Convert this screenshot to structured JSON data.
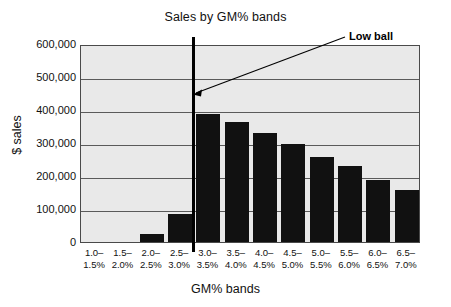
{
  "chart_data": {
    "type": "bar",
    "title": "Sales by GM% bands",
    "xlabel": "GM% bands",
    "ylabel": "$ sales",
    "categories": [
      "1.0–1.5%",
      "1.5–2.0%",
      "2.0–2.5%",
      "2.5–3.0%",
      "3.0–3.5%",
      "3.5–4.0%",
      "4.0–4.5%",
      "4.5–5.0%",
      "5.0–5.5%",
      "5.5–6.0%",
      "6.0–6.5%",
      "6.5–7.0%"
    ],
    "category_lines": [
      [
        "1.0–",
        "1.5%"
      ],
      [
        "1.5–",
        "2.0%"
      ],
      [
        "2.0–",
        "2.5%"
      ],
      [
        "2.5–",
        "3.0%"
      ],
      [
        "3.0–",
        "3.5%"
      ],
      [
        "3.5–",
        "4.0%"
      ],
      [
        "4.0–",
        "4.5%"
      ],
      [
        "4.5–",
        "5.0%"
      ],
      [
        "5.0–",
        "5.5%"
      ],
      [
        "5.5–",
        "6.0%"
      ],
      [
        "6.0–",
        "6.5%"
      ],
      [
        "6.5–",
        "7.0%"
      ]
    ],
    "values": [
      0,
      0,
      25000,
      85000,
      388000,
      365000,
      331000,
      297000,
      258000,
      229000,
      189000,
      157000
    ],
    "ylim": [
      0,
      600000
    ],
    "ytick_values": [
      600000,
      500000,
      400000,
      300000,
      200000,
      100000,
      0
    ],
    "ytick_labels": [
      "600,000",
      "500,000",
      "400,000",
      "300,000",
      "200,000",
      "100,000",
      "0"
    ],
    "grid": true,
    "legend": false,
    "bar_color": "#111111",
    "plot_background": "#e9e9e9",
    "gridline_color": "#5a5a5a",
    "annotations": [
      {
        "text": "Low ball",
        "target_category": "2.5–3.0%",
        "note": "arrow points to vertical divider between 2.5–3.0% and 3.0–3.5% bands"
      }
    ],
    "divider": {
      "after_category": "2.5–3.0%",
      "color": "#000000"
    }
  }
}
